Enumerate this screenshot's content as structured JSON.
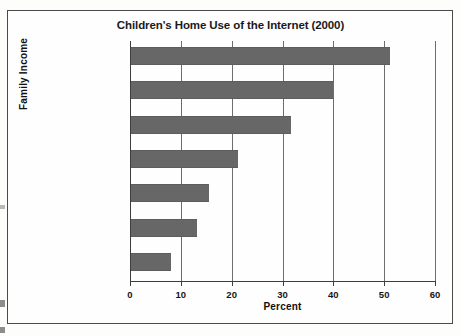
{
  "chart_data": {
    "type": "bar",
    "orientation": "horizontal",
    "title": "Children's Home Use of the Internet (2000)",
    "xlabel": "Percent",
    "ylabel": "Family Income",
    "xlim": [
      0,
      60
    ],
    "xticks": [
      0,
      10,
      20,
      30,
      40,
      50,
      60
    ],
    "grid": "vertical",
    "legend": "none",
    "bar_color": "#676767",
    "categories": [
      "$75,000 and over",
      "$50,000 - $74,999",
      "$35,000 - $49,999",
      "$25,000 - $34,999",
      "$20,000 - $24,999",
      "$15,000 - $19,999",
      "Under $15,000"
    ],
    "values": [
      51,
      39.7,
      31.5,
      21,
      15.4,
      13,
      7.9
    ]
  }
}
